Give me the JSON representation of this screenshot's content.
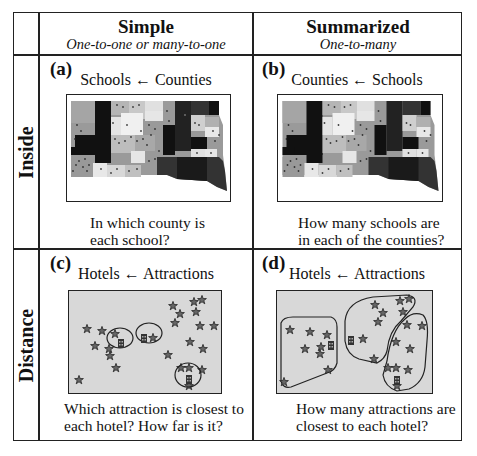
{
  "table": {
    "columns": [
      {
        "title": "Simple",
        "subtitle": "One-to-one or many-to-one"
      },
      {
        "title": "Summarized",
        "subtitle": "One-to-many"
      }
    ],
    "rows": [
      {
        "label": "Inside"
      },
      {
        "label": "Distance"
      }
    ],
    "cells": {
      "a": {
        "label": "(a)",
        "relation_target": "Schools",
        "relation_source": "Counties",
        "arrow": "←",
        "question_line1": "In which county is",
        "question_line2": "each school?",
        "figure": "county-map-with-school-points"
      },
      "b": {
        "label": "(b)",
        "relation_target": "Counties",
        "relation_source": "Schools",
        "arrow": "←",
        "question_line1": "How many schools are",
        "question_line2": "in each of the counties?",
        "figure": "county-map-with-school-points"
      },
      "c": {
        "label": "(c)",
        "relation_target": "Hotels",
        "relation_source": "Attractions",
        "arrow": "←",
        "question_line1": "Which attraction is closest to",
        "question_line2": "each hotel? How far is it?",
        "figure": "hotels-with-nearest-attraction-circles"
      },
      "d": {
        "label": "(d)",
        "relation_target": "Hotels",
        "relation_source": "Attractions",
        "arrow": "←",
        "question_line1": "How many attractions are",
        "question_line2": "closest to each hotel?",
        "figure": "hotels-with-attraction-zones"
      }
    }
  },
  "colors": {
    "border": "#222222",
    "map_bg": "#d8d8d8",
    "dark_county": "#111111"
  }
}
